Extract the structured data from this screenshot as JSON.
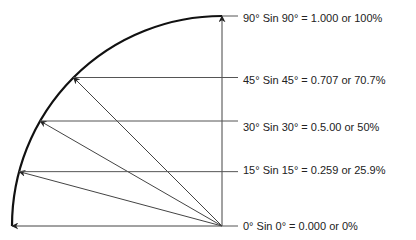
{
  "diagram": {
    "center": {
      "x": 222,
      "y": 226
    },
    "radius": 210,
    "colors": {
      "arc": "#111111",
      "lines": "#444444",
      "text": "#222222"
    },
    "angles": [
      {
        "deg": 90,
        "label": "90° Sin 90° = 1.000 or 100%"
      },
      {
        "deg": 45,
        "label": "45° Sin 45° = 0.707 or 70.7%"
      },
      {
        "deg": 30,
        "label": "30° Sin 30° = 0.5.00 or 50%"
      },
      {
        "deg": 15,
        "label": "15° Sin 15° = 0.259 or 25.9%"
      },
      {
        "deg": 0,
        "label": "0° Sin 0° = 0.000 or 0%"
      }
    ]
  }
}
